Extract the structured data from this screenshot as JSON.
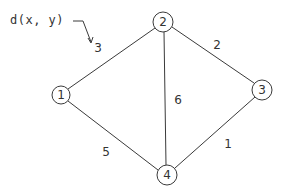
{
  "diagram": {
    "type": "weighted-undirected-graph",
    "annotation": {
      "text": "d(x, y)",
      "points_to": "edge-1-2-weight"
    },
    "nodes": [
      {
        "id": "1",
        "label": "1",
        "x": 61,
        "y": 95
      },
      {
        "id": "2",
        "label": "2",
        "x": 163,
        "y": 22
      },
      {
        "id": "3",
        "label": "3",
        "x": 262,
        "y": 90
      },
      {
        "id": "4",
        "label": "4",
        "x": 167,
        "y": 175
      }
    ],
    "edges": [
      {
        "from": "1",
        "to": "2",
        "weight": "3"
      },
      {
        "from": "2",
        "to": "3",
        "weight": "2"
      },
      {
        "from": "2",
        "to": "4",
        "weight": "6"
      },
      {
        "from": "1",
        "to": "4",
        "weight": "5"
      },
      {
        "from": "3",
        "to": "4",
        "weight": "1"
      }
    ]
  }
}
